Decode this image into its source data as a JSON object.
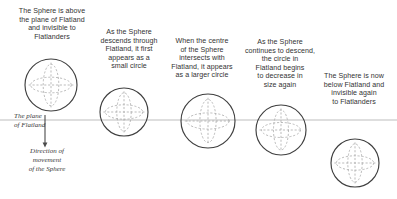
{
  "figure": {
    "background_color": "#ffffff",
    "line_color": "#3f3f3f",
    "dash_color": "#a9a9a9",
    "plane_color": "#b5b5b5",
    "text_color": "#333333"
  },
  "plane": {
    "line_y": 120,
    "x_start": 0,
    "x_end": 397,
    "label_top": "The plane",
    "label_bottom": "of Flatland",
    "label_full": "The plane\nof Flatland"
  },
  "arrow": {
    "label": "Direction of\nmovement\nof the Sphere",
    "line_1": "Direction of",
    "line_2": "movement",
    "line_3": "of the Sphere",
    "x": 45,
    "y_start": 115,
    "y_end": 147,
    "direction": "down"
  },
  "captions": [
    {
      "id": "caption-1",
      "text": "The Sphere is above\nthe plane of Flatland\nand invisible to\nFlatlanders",
      "lines": [
        "The Sphere is above",
        "the plane of Flatland",
        "and invisible to",
        "Flatlanders"
      ],
      "x": 6,
      "y": 7,
      "width": 92
    },
    {
      "id": "caption-2",
      "text": "As the Sphere\ndescends through\nFlatland, it first\nappears as a\nsmall circle",
      "lines": [
        "As the Sphere",
        "descends through",
        "Flatland, it first",
        "appears as a",
        "small circle"
      ],
      "x": 90,
      "y": 28,
      "width": 78
    },
    {
      "id": "caption-3",
      "text": "When the centre\nof the Sphere\nintersects with\nFlatland, it appears\nas a larger circle",
      "lines": [
        "When the centre",
        "of the Sphere",
        "intersects with",
        "Flatland, it appears",
        "as a larger circle"
      ],
      "x": 161,
      "y": 37,
      "width": 82
    },
    {
      "id": "caption-4",
      "text": "As the Sphere\ncontinues to descend,\nthe circle in\nFlatland begins\nto decrease in\nsize again",
      "lines": [
        "As the Sphere",
        "continues to descend,",
        "the circle in",
        "Flatland begins",
        "to decrease in",
        "size again"
      ],
      "x": 238,
      "y": 38,
      "width": 84
    },
    {
      "id": "caption-5",
      "text": "The Sphere is now\nbelow Flatland and\ninvisible again\nto Flatlanders",
      "lines": [
        "The Sphere is now",
        "below Flatland and",
        "invisible again",
        "to Flatlanders"
      ],
      "x": 312,
      "y": 72,
      "width": 84
    }
  ],
  "spheres": [
    {
      "id": "sphere-1",
      "cx": 51,
      "cy": 85,
      "r": 26,
      "position": "above-plane"
    },
    {
      "id": "sphere-2",
      "cx": 124,
      "cy": 112,
      "r": 24,
      "position": "entering-plane"
    },
    {
      "id": "sphere-3",
      "cx": 208,
      "cy": 121,
      "r": 27,
      "position": "centre-at-plane"
    },
    {
      "id": "sphere-4",
      "cx": 281,
      "cy": 130,
      "r": 25,
      "position": "exiting-plane"
    },
    {
      "id": "sphere-5",
      "cx": 355,
      "cy": 163,
      "r": 24,
      "position": "below-plane"
    }
  ]
}
